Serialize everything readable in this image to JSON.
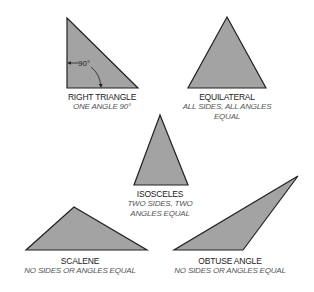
{
  "colors": {
    "fill": "#a3a3a3",
    "stroke": "#222222",
    "name_text": "#222222",
    "desc_text": "#555555"
  },
  "triangles": [
    {
      "id": "right",
      "name": "RIGHT TRIANGLE",
      "desc": [
        "ONE ANGLE 90°"
      ],
      "angle_label": "90°",
      "points": "67,18 67,88 138,88"
    },
    {
      "id": "equilateral",
      "name": "EQUILATERAL",
      "desc": [
        "ALL SIDES, ALL ANGLES",
        "EQUAL"
      ],
      "points": "227,17 188,88 266,88"
    },
    {
      "id": "isosceles",
      "name": "ISOSCELES",
      "desc": [
        "TWO SIDES, TWO",
        "ANGLES EQUAL"
      ],
      "points": "160,115 134,185 188,185"
    },
    {
      "id": "scalene",
      "name": "SCALENE",
      "desc": [
        "NO SIDES OR ANGLES EQUAL"
      ],
      "points": "74,207 26,250 147,250"
    },
    {
      "id": "obtuse",
      "name": "OBTUSE ANGLE",
      "desc": [
        "NO SIDES OR ANGLES EQUAL"
      ],
      "points": "298,176 174,250 243,250"
    }
  ]
}
